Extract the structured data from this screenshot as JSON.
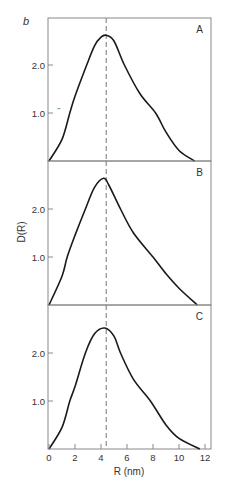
{
  "figure_label": "b",
  "ylabel": "D(R)",
  "xlabel": "R (nm)",
  "colors": {
    "curve": "#1a1a1a",
    "frame": "#888888",
    "dashed": "#777777"
  },
  "chart_data": [
    {
      "type": "line",
      "panel": "A",
      "title": "A",
      "xlabel": "R (nm)",
      "ylabel": "D(R)",
      "xlim": [
        0,
        12.5
      ],
      "ylim": [
        0,
        2.9
      ],
      "yticks": [
        "1.0",
        "2.0"
      ],
      "xticks": [],
      "grid": false,
      "reference_line_x": 4.4,
      "x": [
        0,
        1,
        1.6,
        2,
        2.9,
        3.5,
        4,
        4.4,
        5,
        5.8,
        7,
        8.2,
        9,
        10,
        11.2
      ],
      "y": [
        0,
        0.45,
        1.0,
        1.35,
        2.0,
        2.4,
        2.58,
        2.62,
        2.5,
        2.0,
        1.4,
        1.0,
        0.6,
        0.22,
        0
      ]
    },
    {
      "type": "line",
      "panel": "B",
      "title": "B",
      "xlabel": "R (nm)",
      "ylabel": "D(R)",
      "xlim": [
        0,
        12.5
      ],
      "ylim": [
        0,
        2.9
      ],
      "yticks": [
        "1.0",
        "2.0"
      ],
      "xticks": [],
      "grid": false,
      "reference_line_x": 4.4,
      "x": [
        0,
        1,
        1.4,
        2,
        2.8,
        3.5,
        4.2,
        4.6,
        5.5,
        6.5,
        8,
        9,
        10,
        11.4
      ],
      "y": [
        0,
        0.6,
        1.0,
        1.45,
        2.0,
        2.45,
        2.64,
        2.5,
        2.0,
        1.5,
        1.0,
        0.65,
        0.35,
        0
      ]
    },
    {
      "type": "line",
      "panel": "C",
      "title": "C",
      "xlabel": "R (nm)",
      "ylabel": "D(R)",
      "xlim": [
        0,
        12.5
      ],
      "ylim": [
        0,
        2.9
      ],
      "yticks": [
        "1.0",
        "2.0"
      ],
      "xticks": [
        "0",
        "2",
        "4",
        "6",
        "8",
        "10",
        "12"
      ],
      "grid": false,
      "reference_line_x": 4.4,
      "x": [
        0,
        1,
        1.6,
        2,
        2.8,
        3.5,
        4.3,
        5,
        5.5,
        6.5,
        7.8,
        9,
        10,
        11.6
      ],
      "y": [
        0,
        0.45,
        1.0,
        1.3,
        2.0,
        2.4,
        2.52,
        2.35,
        2.0,
        1.45,
        1.0,
        0.5,
        0.22,
        0
      ]
    }
  ]
}
